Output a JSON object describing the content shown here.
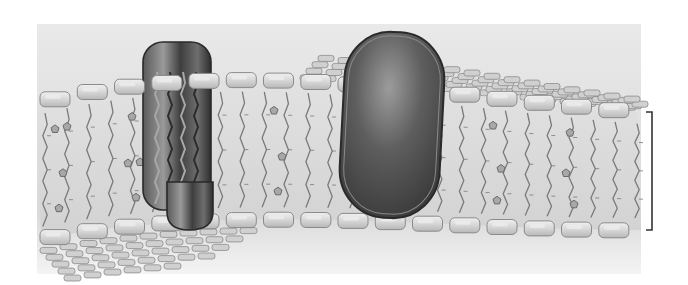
{
  "diagram": {
    "labels": [],
    "colors": {
      "page_background": "#ffffff",
      "panel_top": "#e9e9e9",
      "panel_bottom": "#d9d9d9",
      "panel_fade": "#f4f4f4",
      "membrane_core": "#dcdcdc",
      "head_fill": "#d0d0d0",
      "head_highlight": "#ececec",
      "head_stroke": "#8a8a8a",
      "tail_stroke": "#7a7a7a",
      "cholesterol_fill": "#a8a8a8",
      "cholesterol_stroke": "#6a6a6a",
      "protein_dark": "#4a4a4a",
      "protein_mid": "#7a7a7a",
      "protein_light": "#b4b4b4",
      "protein_outline": "#2a2a2a",
      "bracket": "#333333"
    },
    "panel": {
      "x": 37,
      "y": 24,
      "width": 604,
      "height": 250
    },
    "bilayer": {
      "outer_edge_top": "M37,103 C120,92 190,72 280,66 C380,60 470,82 641,112",
      "inner_edge_bottom": "M37,240 C120,222 190,212 280,202 C380,196 470,210 641,230",
      "back_surface_top": "M300,62 C420,46 540,60 641,76",
      "head_count_top": 16,
      "head_count_bottom": 16,
      "tail_count": 28,
      "cholesterol_count": 26
    },
    "proteins": [
      {
        "name": "channel-protein",
        "shape": "cylinder-with-pore",
        "x": 143,
        "y": 42,
        "width": 68,
        "height": 188
      },
      {
        "name": "globular-integral-protein",
        "shape": "capsule",
        "x": 342,
        "y": 32,
        "width": 100,
        "height": 186
      }
    ],
    "bracket": {
      "side": "right",
      "x": 646,
      "y_top": 112,
      "y_bottom": 230,
      "tick": 6,
      "label": ""
    }
  }
}
